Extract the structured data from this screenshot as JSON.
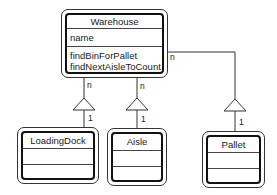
{
  "diagram": {
    "type": "UML class diagram",
    "classes": [
      {
        "name": "Warehouse",
        "attributes": [
          "name"
        ],
        "operations": [
          "findBinForPallet",
          "findNextAisleToCount"
        ]
      },
      {
        "name": "LoadingDock",
        "attributes": [],
        "operations": []
      },
      {
        "name": "Aisle",
        "attributes": [],
        "operations": []
      },
      {
        "name": "Pallet",
        "attributes": [],
        "operations": []
      }
    ],
    "associations": [
      {
        "from": "Warehouse",
        "to": "LoadingDock",
        "from_multiplicity": "n",
        "to_multiplicity": "1",
        "arrow": "hollow-triangle"
      },
      {
        "from": "Warehouse",
        "to": "Aisle",
        "from_multiplicity": "n",
        "to_multiplicity": "1",
        "arrow": "hollow-triangle"
      },
      {
        "from": "Warehouse",
        "to": "Pallet",
        "from_multiplicity": "n",
        "to_multiplicity": "1",
        "arrow": "hollow-triangle"
      }
    ]
  },
  "labels": {
    "warehouse_title": "Warehouse",
    "warehouse_attr_0": "name",
    "warehouse_op_0": "findBinForPallet",
    "warehouse_op_1": "findNextAisleToCount",
    "loadingdock_title": "LoadingDock",
    "aisle_title": "Aisle",
    "pallet_title": "Pallet",
    "mult_n": "n",
    "mult_1": "1"
  },
  "colors": {
    "line": "#333333",
    "border": "#111111",
    "background": "#ffffff"
  }
}
